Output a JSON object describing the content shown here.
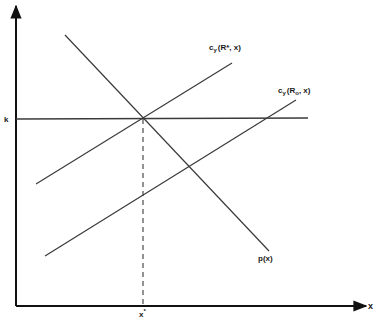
{
  "diagram": {
    "axes": {
      "y_axis": {
        "label": ""
      },
      "x_axis": {
        "label": "x"
      }
    },
    "labels": {
      "k": "k",
      "x_star": "x",
      "x_star_sup": "*",
      "p": "p(x)",
      "cy_rstar_main": "c",
      "cy_rstar_sub": "y",
      "cy_rstar_args": "(R*, x)",
      "cy_ro_main": "c",
      "cy_ro_sub": "y",
      "cy_ro_args_open": "(R",
      "cy_ro_args_sub": "o",
      "cy_ro_args_close": ", x)"
    },
    "curves": [
      {
        "name": "p(x)",
        "type": "downward-sloping line"
      },
      {
        "name": "c_y(R*, x)",
        "type": "upward-sloping line"
      },
      {
        "name": "c_y(R_o, x)",
        "type": "upward-sloping line"
      },
      {
        "name": "k",
        "type": "horizontal line"
      }
    ],
    "colors": {
      "line": "#3a3a3a",
      "axis": "#111111",
      "background": "#ffffff"
    }
  }
}
